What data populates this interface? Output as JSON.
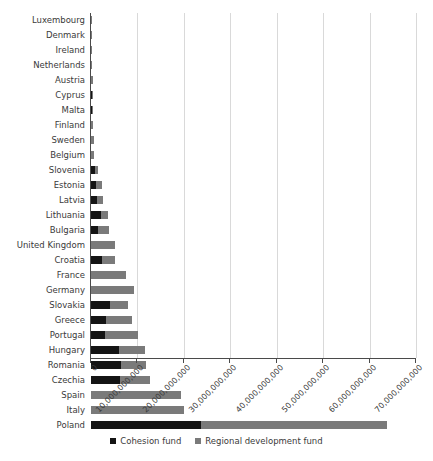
{
  "chart_data": {
    "type": "bar",
    "orientation": "horizontal",
    "stacked": true,
    "title": "",
    "xlabel": "",
    "ylabel": "",
    "xlim": [
      0,
      70000000000
    ],
    "grid": true,
    "legend_position": "bottom",
    "tick_labels": [
      "0",
      "10,000,000,000",
      "20,000,000,000",
      "30,000,000,000",
      "40,000,000,000",
      "50,000,000,000",
      "60,000,000,000",
      "70,000,000,000"
    ],
    "tick_values": [
      0,
      10000000000,
      20000000000,
      30000000000,
      40000000000,
      50000000000,
      60000000000,
      70000000000
    ],
    "categories": [
      "Luxembourg",
      "Denmark",
      "Ireland",
      "Netherlands",
      "Austria",
      "Cyprus",
      "Malta",
      "Finland",
      "Sweden",
      "Belgium",
      "Slovenia",
      "Estonia",
      "Latvia",
      "Lithuania",
      "Bulgaria",
      "United Kingdom",
      "Croatia",
      "France",
      "Germany",
      "Slovakia",
      "Greece",
      "Portugal",
      "Hungary",
      "Romania",
      "Czechia",
      "Spain",
      "Italy",
      "Poland"
    ],
    "series": [
      {
        "name": "Cohesion fund",
        "color": "#141414",
        "values": [
          0,
          0,
          0,
          0,
          0,
          260000000,
          220000000,
          0,
          0,
          0,
          900000000,
          1100000000,
          1350000000,
          2050000000,
          1600000000,
          0,
          2400000000,
          0,
          0,
          4100000000,
          3250000000,
          3100000000,
          6000000000,
          6400000000,
          6300000000,
          0,
          0,
          23700000000
        ]
      },
      {
        "name": "Regional development fund",
        "color": "#7a7a7a",
        "values": [
          60000000,
          80000000,
          200000000,
          280000000,
          400000000,
          170000000,
          140000000,
          450000000,
          680000000,
          730000000,
          640000000,
          1350000000,
          1300000000,
          1600000000,
          2200000000,
          5150000000,
          2800000000,
          7500000000,
          9200000000,
          3950000000,
          5650000000,
          7050000000,
          5700000000,
          5400000000,
          6300000000,
          19400000000,
          20100000000,
          40100000000
        ]
      }
    ]
  },
  "legend": {
    "items": [
      {
        "label": "Cohesion fund",
        "color": "#141414"
      },
      {
        "label": "Regional development fund",
        "color": "#7a7a7a"
      }
    ]
  },
  "title_strip": ""
}
